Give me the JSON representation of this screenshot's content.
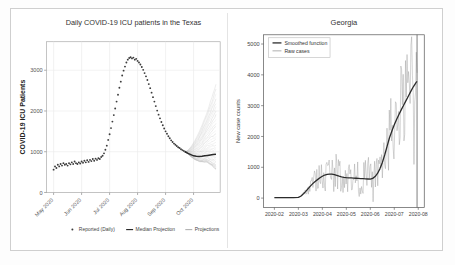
{
  "figure": {
    "background_color": "#ffffff",
    "frame_color": "#cfcfcf",
    "panel_count": 2
  },
  "chart_data": [
    {
      "panel": "left",
      "type": "line",
      "title": "Daily COVID-19 ICU patients in the Texas",
      "xlabel": "",
      "ylabel": "COVID-19 ICU Patients",
      "ylim": [
        0,
        3700
      ],
      "yticks": [
        0,
        1000,
        2000,
        3000
      ],
      "ytick_labels": [
        "0",
        "1000",
        "2000",
        "3000"
      ],
      "xticks": [
        0,
        1,
        2,
        3,
        4,
        5
      ],
      "xtick_labels": [
        "May 2020",
        "Jun 2020",
        "Jul 2020",
        "Aug 2020",
        "Sep 2020",
        "Oct 2020"
      ],
      "xtick_rotation": 45,
      "grid": true,
      "legend_position": "below",
      "legend": [
        {
          "label": "Reported (Daily)",
          "marker": "dot",
          "color": "#3c3c3c"
        },
        {
          "label": "Median Projection",
          "marker": "line",
          "color": "#2b2b2b"
        },
        {
          "label": "Projections",
          "marker": "line",
          "color": "#b4b4b4"
        }
      ],
      "series": [
        {
          "name": "Reported (Daily)",
          "style": "dots",
          "color": "#3c3c3c",
          "x": [
            0.0,
            0.05,
            0.1,
            0.15,
            0.2,
            0.25,
            0.3,
            0.35,
            0.4,
            0.45,
            0.5,
            0.55,
            0.6,
            0.65,
            0.7,
            0.75,
            0.8,
            0.85,
            0.9,
            0.95,
            1.0,
            1.05,
            1.1,
            1.15,
            1.2,
            1.25,
            1.3,
            1.35,
            1.4,
            1.45,
            1.5,
            1.55,
            1.6,
            1.65,
            1.7,
            1.75,
            1.8,
            1.85,
            1.9,
            1.95,
            2.0,
            2.05,
            2.1,
            2.15,
            2.2,
            2.25,
            2.3,
            2.35,
            2.4,
            2.45,
            2.5,
            2.55,
            2.6,
            2.65,
            2.7,
            2.75,
            2.8,
            2.85,
            2.9,
            2.95,
            3.0,
            3.05,
            3.1,
            3.15,
            3.2,
            3.25,
            3.3,
            3.35,
            3.4,
            3.45,
            3.5,
            3.55,
            3.6,
            3.65,
            3.7,
            3.75,
            3.8,
            3.85,
            3.9,
            3.95,
            4.0,
            4.05,
            4.1,
            4.15,
            4.2,
            4.25,
            4.3,
            4.35,
            4.4,
            4.45,
            4.5,
            4.55,
            4.6,
            4.65,
            4.7
          ],
          "y": [
            560,
            640,
            600,
            680,
            640,
            700,
            660,
            720,
            680,
            700,
            660,
            720,
            690,
            740,
            700,
            760,
            720,
            700,
            740,
            710,
            760,
            730,
            780,
            740,
            790,
            750,
            800,
            770,
            820,
            780,
            830,
            800,
            840,
            820,
            870,
            900,
            960,
            1050,
            1150,
            1290,
            1430,
            1580,
            1740,
            1900,
            2060,
            2230,
            2400,
            2570,
            2720,
            2870,
            2990,
            3090,
            3190,
            3260,
            3300,
            3320,
            3290,
            3310,
            3260,
            3280,
            3230,
            3190,
            3140,
            3080,
            3010,
            2930,
            2850,
            2760,
            2660,
            2560,
            2450,
            2340,
            2230,
            2120,
            2010,
            1910,
            1820,
            1730,
            1650,
            1570,
            1500,
            1440,
            1380,
            1330,
            1280,
            1240,
            1200,
            1170,
            1140,
            1110,
            1090,
            1060,
            1040,
            1020,
            1000
          ]
        },
        {
          "name": "Median Projection",
          "style": "line",
          "color": "#2b2b2b",
          "x": [
            4.7,
            4.8,
            4.9,
            5.0,
            5.1,
            5.2,
            5.3,
            5.4,
            5.5,
            5.6,
            5.7,
            5.8
          ],
          "y": [
            1000,
            960,
            930,
            900,
            890,
            885,
            890,
            900,
            910,
            920,
            930,
            940
          ]
        }
      ],
      "projection_fan": {
        "name": "Projections",
        "color": "#b9b9b9",
        "start_x": 4.7,
        "end_x": 5.8,
        "start_y": 1000,
        "end_y_min": 580,
        "end_y_max": 2650,
        "line_count": 34
      }
    },
    {
      "panel": "right",
      "type": "line",
      "title": "Georgia",
      "xlabel": "",
      "ylabel": "New case counts",
      "ylim": [
        -300,
        5300
      ],
      "yticks": [
        0,
        1000,
        2000,
        3000,
        4000,
        5000
      ],
      "ytick_labels": [
        "0",
        "1000",
        "2000",
        "3000",
        "4000",
        "5000"
      ],
      "xticks": [
        0,
        1,
        2,
        3,
        4,
        5,
        6
      ],
      "xtick_labels": [
        "2020-02",
        "2020-03",
        "2020-04",
        "2020-05",
        "2020-06",
        "2020-07",
        "2020-08"
      ],
      "grid": false,
      "legend_position": "upper left",
      "legend": [
        {
          "label": "Smoothed function",
          "marker": "line",
          "color": "#2b2b2b"
        },
        {
          "label": "Raw cases",
          "marker": "line",
          "color": "#9a9a9a"
        }
      ],
      "vline_x": 5.95,
      "series": [
        {
          "name": "Smoothed function",
          "style": "line",
          "color": "#2b2b2b",
          "x": [
            0.0,
            0.2,
            0.4,
            0.6,
            0.8,
            1.0,
            1.1,
            1.2,
            1.3,
            1.4,
            1.5,
            1.6,
            1.7,
            1.8,
            1.9,
            2.0,
            2.1,
            2.2,
            2.3,
            2.4,
            2.5,
            2.6,
            2.7,
            2.8,
            2.9,
            3.0,
            3.1,
            3.2,
            3.3,
            3.4,
            3.5,
            3.6,
            3.7,
            3.8,
            3.9,
            4.0,
            4.1,
            4.2,
            4.3,
            4.4,
            4.5,
            4.6,
            4.7,
            4.8,
            4.9,
            5.0,
            5.1,
            5.2,
            5.3,
            5.4,
            5.5,
            5.6,
            5.7,
            5.8,
            5.9,
            5.95
          ],
          "y": [
            15,
            15,
            15,
            15,
            18,
            25,
            60,
            130,
            210,
            300,
            390,
            470,
            540,
            600,
            660,
            710,
            750,
            770,
            780,
            775,
            760,
            735,
            710,
            690,
            675,
            665,
            660,
            655,
            650,
            645,
            640,
            635,
            630,
            625,
            620,
            615,
            640,
            700,
            800,
            950,
            1150,
            1400,
            1680,
            1960,
            2180,
            2380,
            2560,
            2720,
            2880,
            3030,
            3180,
            3330,
            3480,
            3620,
            3740,
            3790
          ]
        },
        {
          "name": "Raw cases",
          "style": "noisy-line",
          "color": "#9a9a9a",
          "noise_start_x": 1.05,
          "noise_peak_x": 5.95
        }
      ]
    }
  ]
}
